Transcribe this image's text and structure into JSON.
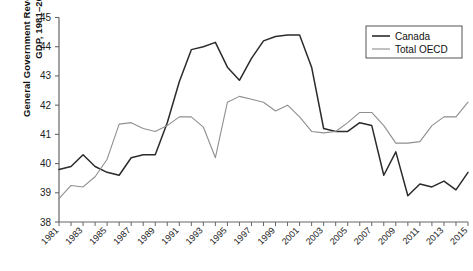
{
  "chart_data": {
    "type": "line",
    "title": "",
    "xlabel": "",
    "ylabel": "General Government Revenue Total, % of GDP, 1981–2015",
    "ylim": [
      38,
      45
    ],
    "xlim": [
      1981,
      2015
    ],
    "ytick_labels": [
      "38",
      "39",
      "40",
      "41",
      "42",
      "43",
      "44",
      "45"
    ],
    "ytick_values": [
      38,
      39,
      40,
      41,
      42,
      43,
      44,
      45
    ],
    "xtick_labels": [
      "1981",
      "1983",
      "1985",
      "1987",
      "1989",
      "1991",
      "1993",
      "1995",
      "1997",
      "1999",
      "2001",
      "2003",
      "2005",
      "2007",
      "2009",
      "2011",
      "2013",
      "2015"
    ],
    "xtick_minor_every_year": true,
    "grid": false,
    "legend_position": "top-right",
    "x": [
      1981,
      1982,
      1983,
      1984,
      1985,
      1986,
      1987,
      1988,
      1989,
      1990,
      1991,
      1992,
      1993,
      1994,
      1995,
      1996,
      1997,
      1998,
      1999,
      2000,
      2001,
      2002,
      2003,
      2004,
      2005,
      2006,
      2007,
      2008,
      2009,
      2010,
      2011,
      2012,
      2013,
      2014,
      2015
    ],
    "series": [
      {
        "name": "Canada",
        "color": "#2b2b2b",
        "values": [
          39.8,
          39.9,
          40.3,
          39.9,
          39.7,
          39.6,
          40.2,
          40.3,
          40.3,
          41.4,
          42.8,
          43.9,
          44.0,
          44.15,
          43.3,
          42.85,
          43.6,
          44.2,
          44.35,
          44.4,
          44.4,
          43.3,
          41.2,
          41.1,
          41.1,
          41.4,
          41.3,
          39.6,
          40.4,
          38.9,
          39.3,
          39.2,
          39.4,
          39.1,
          39.7
        ]
      },
      {
        "name": "Total OECD",
        "color": "#8f8f8f",
        "values": [
          38.8,
          39.25,
          39.2,
          39.55,
          40.15,
          41.35,
          41.4,
          41.2,
          41.1,
          41.3,
          41.6,
          41.6,
          41.25,
          40.2,
          42.1,
          42.3,
          42.2,
          42.1,
          41.8,
          42.0,
          41.6,
          41.1,
          41.05,
          41.1,
          41.4,
          41.75,
          41.75,
          41.3,
          40.7,
          40.7,
          40.75,
          41.3,
          41.6,
          41.6,
          42.1
        ]
      }
    ]
  },
  "legend": {
    "items": [
      {
        "label": "Canada"
      },
      {
        "label": "Total OECD"
      }
    ]
  }
}
